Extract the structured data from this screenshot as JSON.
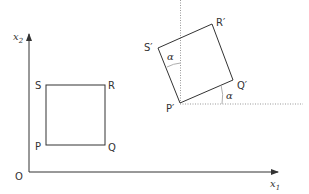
{
  "diagram": {
    "axes": {
      "origin_label": "O",
      "x_axis_label": "x",
      "x_axis_subscript": "1",
      "y_axis_label": "x",
      "y_axis_subscript": "2"
    },
    "original_square": {
      "vertices": {
        "P": "P",
        "Q": "Q",
        "R": "R",
        "S": "S"
      }
    },
    "rotated_square": {
      "vertices": {
        "P": "P′",
        "Q": "Q′",
        "R": "R′",
        "S": "S′"
      }
    },
    "angle_label_1": "α",
    "angle_label_2": "α",
    "colors": {
      "stroke": "#333333",
      "dotted": "#888888",
      "background": "#ffffff"
    }
  }
}
